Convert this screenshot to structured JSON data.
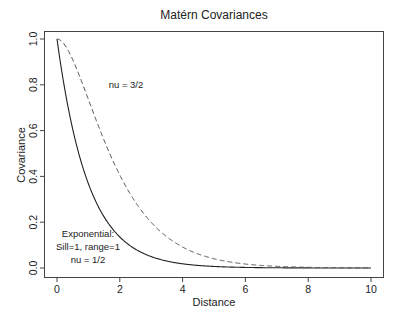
{
  "chart_data": {
    "type": "line",
    "title": "Matérn Covariances",
    "xlabel": "Distance",
    "ylabel": "Covariance",
    "xlim": [
      0,
      10
    ],
    "ylim": [
      0,
      1
    ],
    "xticks": [
      0,
      2,
      4,
      6,
      8,
      10
    ],
    "xtick_labels": [
      "0",
      "2",
      "4",
      "6",
      "8",
      "10"
    ],
    "yticks": [
      0.0,
      0.2,
      0.4,
      0.6,
      0.8,
      1.0
    ],
    "ytick_labels": [
      "0.0",
      "0.2",
      "0.4",
      "0.6",
      "0.8",
      "1.0"
    ],
    "grid": false,
    "legend": null,
    "series": [
      {
        "name": "Exponential (nu = 1/2)",
        "style": "solid",
        "color": "#222222",
        "formula": "exp(-d)",
        "x": [
          0,
          0.25,
          0.5,
          0.75,
          1,
          1.5,
          2,
          2.5,
          3,
          4,
          5,
          6,
          7,
          8,
          9,
          10
        ],
        "values": [
          1.0,
          0.779,
          0.607,
          0.472,
          0.368,
          0.223,
          0.135,
          0.082,
          0.05,
          0.018,
          0.007,
          0.002,
          0.001,
          0.0003,
          0.0001,
          0.0
        ]
      },
      {
        "name": "nu = 3/2",
        "style": "dashed",
        "color": "#555555",
        "formula": "(1+d)exp(-d)",
        "x": [
          0,
          0.25,
          0.5,
          0.75,
          1,
          1.5,
          2,
          2.5,
          3,
          4,
          5,
          6,
          7,
          8,
          9,
          10
        ],
        "values": [
          1.0,
          0.974,
          0.91,
          0.827,
          0.736,
          0.558,
          0.406,
          0.287,
          0.199,
          0.092,
          0.04,
          0.017,
          0.007,
          0.003,
          0.001,
          0.0005
        ]
      }
    ],
    "annotations": [
      {
        "text": "nu = 3/2",
        "x": 2.15,
        "y": 0.8
      },
      {
        "lines": [
          "Exponential:",
          "Sill=1, range=1",
          "nu = 1/2"
        ],
        "x": 1.0,
        "y": 0.17
      }
    ]
  },
  "plot": {
    "title": "Matérn Covariances",
    "xlabel": "Distance",
    "ylabel": "Covariance",
    "annot_nu32": "nu = 3/2",
    "annot_exp_line1": "Exponential:",
    "annot_exp_line2": "Sill=1, range=1",
    "annot_exp_line3": "nu = 1/2"
  }
}
